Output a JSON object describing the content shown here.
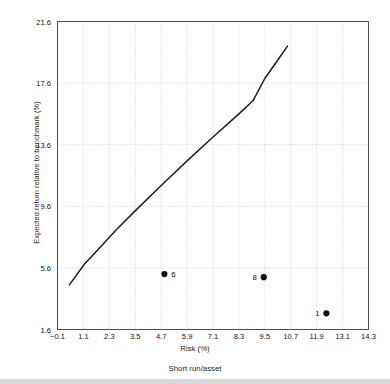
{
  "chart_data": {
    "type": "line",
    "title": "",
    "subtitle": "Short run/asset",
    "xlabel": "Risk (%)",
    "ylabel": "Expected return relative to benchmark (%)",
    "xlim": [
      -0.1,
      14.3
    ],
    "ylim": [
      1.6,
      21.6
    ],
    "grid": true,
    "legend": "none",
    "xticks": [
      "−0.1",
      "1.1",
      "2.3",
      "3.5",
      "4.7",
      "5.9",
      "7.1",
      "8.3",
      "9.5",
      "10.7",
      "11.9",
      "13.1",
      "14.3"
    ],
    "xtick_values": [
      -0.1,
      1.1,
      2.3,
      3.5,
      4.7,
      5.9,
      7.1,
      8.3,
      9.5,
      10.7,
      11.9,
      13.1,
      14.3
    ],
    "yticks": [
      "1.6",
      "5.6",
      "9.6",
      "13.6",
      "17.6",
      "21.6"
    ],
    "ytick_values": [
      1.6,
      5.6,
      9.6,
      13.6,
      17.6,
      21.6
    ],
    "series": [
      {
        "name": "Efficient frontier",
        "type": "line",
        "color": "#1f1f1f",
        "x": [
          0.45,
          1.15,
          1.75,
          2.6,
          3.6,
          4.7,
          5.9,
          7.1,
          8.3,
          8.95,
          9.5,
          10.1,
          10.55
        ],
        "y": [
          4.5,
          5.85,
          6.75,
          8.05,
          9.45,
          10.95,
          12.55,
          14.1,
          15.6,
          16.45,
          17.9,
          19.1,
          20.0
        ]
      },
      {
        "name": "Individual assets",
        "type": "scatter",
        "color": "#111111",
        "points": [
          {
            "label": "6",
            "x": 4.85,
            "y": 5.2,
            "label_side": "right"
          },
          {
            "label": "8",
            "x": 9.45,
            "y": 5.0,
            "label_side": "left"
          },
          {
            "label": "1",
            "x": 12.35,
            "y": 2.65,
            "label_side": "left"
          }
        ]
      }
    ]
  },
  "axes": {
    "frame_color": "#4d4d4d",
    "grid_color": "#bfbfbf"
  }
}
